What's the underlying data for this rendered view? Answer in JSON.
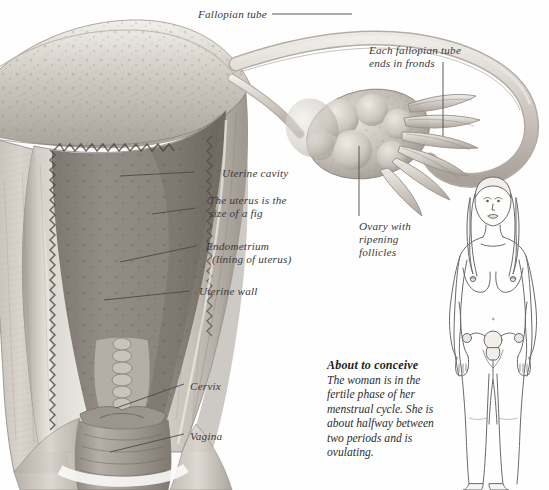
{
  "illustration": {
    "title": "Female reproductive organs cross-section",
    "subject": "uterus-fallopian-tube-ovary",
    "style": "grayscale pencil anatomical illustration",
    "palette": {
      "background": "#fefefe",
      "tissue_light": "#e2ded8",
      "tissue_mid": "#b9b3ab",
      "tissue_dark": "#8e8880",
      "cavity_shadow": "#6f6a64",
      "outline": "#4a4a4a",
      "label_text": "#3a3a3a",
      "caption_heading": "#1d1d1d"
    }
  },
  "labels": [
    {
      "id": "fallopian-tube",
      "text": "Fallopian tube",
      "x": 198,
      "y": 8
    },
    {
      "id": "fronds",
      "text": "Each fallopian tube\nends in fronds",
      "x": 369,
      "y": 44
    },
    {
      "id": "uterine-cavity",
      "text": "Uterine cavity",
      "x": 222,
      "y": 167
    },
    {
      "id": "size-of-fig",
      "text": "The uterus is the\nsize of a fig",
      "x": 209,
      "y": 194
    },
    {
      "id": "endometrium",
      "text": "Endometrium\n  (lining of uterus)",
      "x": 206,
      "y": 240
    },
    {
      "id": "uterine-wall",
      "text": "Uterine wall",
      "x": 199,
      "y": 285
    },
    {
      "id": "ovary",
      "text": "Ovary with\nripening\nfollicles",
      "x": 359,
      "y": 220
    },
    {
      "id": "cervix",
      "text": "Cervix",
      "x": 190,
      "y": 380
    },
    {
      "id": "vagina",
      "text": "Vagina",
      "x": 190,
      "y": 430
    }
  ],
  "caption": {
    "heading": "About to conceive",
    "body": "The woman is in the fertile phase of her menstrual cycle. She is about halfway between two periods and is ovulating."
  },
  "figure": {
    "name": "female-body-diagram"
  }
}
